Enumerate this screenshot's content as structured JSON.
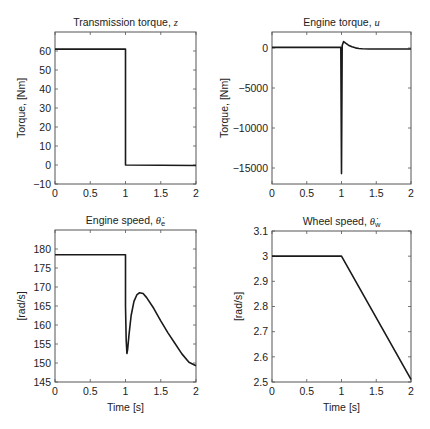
{
  "chart_data": [
    {
      "type": "line",
      "id": "transmission-torque",
      "title": "Transmission torque, ",
      "title_math": "z",
      "xlabel": "",
      "ylabel": "Torque, [Nm]",
      "xlim": [
        0,
        2
      ],
      "ylim": [
        -10,
        70
      ],
      "xticks": [
        0,
        0.5,
        1,
        1.5,
        2
      ],
      "xtick_labels": [
        "0",
        "0.5",
        "1",
        "1.5",
        "2"
      ],
      "yticks": [
        -10,
        0,
        10,
        20,
        30,
        40,
        50,
        60
      ],
      "ytick_labels": [
        "−10",
        "0",
        "10",
        "20",
        "30",
        "40",
        "50",
        "60"
      ],
      "box": [
        55,
        32,
        196,
        184
      ],
      "series": [
        {
          "name": "z",
          "x": [
            0,
            1,
            1,
            2
          ],
          "y": [
            61,
            61,
            0,
            -0.3
          ]
        }
      ]
    },
    {
      "type": "line",
      "id": "engine-torque",
      "title": "Engine torque, ",
      "title_math": "u",
      "xlabel": "",
      "ylabel": "Torque, [Nm]",
      "xlim": [
        0,
        2
      ],
      "ylim": [
        -17000,
        2000
      ],
      "xticks": [
        0,
        0.5,
        1,
        1.5,
        2
      ],
      "xtick_labels": [
        "0",
        "0.5",
        "1",
        "1.5",
        "2"
      ],
      "yticks": [
        -15000,
        -10000,
        -5000,
        0
      ],
      "ytick_labels": [
        "−15000",
        "−10000",
        "−5000",
        "0"
      ],
      "box": [
        272,
        32,
        411,
        184
      ],
      "series": [
        {
          "name": "u",
          "x": [
            0,
            0.99,
            1.0,
            1.01,
            1.03,
            1.06,
            1.1,
            1.15,
            1.2,
            1.25,
            1.3,
            1.4,
            1.5,
            1.7,
            2.0
          ],
          "y": [
            80,
            80,
            -15700,
            300,
            800,
            600,
            350,
            150,
            20,
            -60,
            -100,
            -120,
            -120,
            -120,
            -120
          ]
        }
      ]
    },
    {
      "type": "line",
      "id": "engine-speed",
      "title": "Engine speed, ",
      "title_math": "θ̇",
      "title_sub": "e",
      "xlabel": "Time [s]",
      "ylabel": "[rad/s]",
      "xlim": [
        0,
        2
      ],
      "ylim": [
        145,
        185
      ],
      "xticks": [
        0,
        0.5,
        1,
        1.5,
        2
      ],
      "xtick_labels": [
        "0",
        "0.5",
        "1",
        "1.5",
        "2"
      ],
      "yticks": [
        145,
        150,
        155,
        160,
        165,
        170,
        175,
        180
      ],
      "ytick_labels": [
        "145",
        "150",
        "155",
        "160",
        "165",
        "170",
        "175",
        "180"
      ],
      "box": [
        55,
        230,
        196,
        382
      ],
      "series": [
        {
          "name": "theta_e_dot",
          "x": [
            0,
            1.0,
            1.0,
            1.01,
            1.02,
            1.03,
            1.05,
            1.08,
            1.12,
            1.16,
            1.2,
            1.25,
            1.3,
            1.4,
            1.5,
            1.6,
            1.7,
            1.8,
            1.9,
            2.0
          ],
          "y": [
            178.5,
            178.5,
            165,
            156,
            152.5,
            153.5,
            157.5,
            162.5,
            166.2,
            167.9,
            168.5,
            168.3,
            167.2,
            164.4,
            161.1,
            158.0,
            155.2,
            152.4,
            150.2,
            149.3
          ]
        }
      ]
    },
    {
      "type": "line",
      "id": "wheel-speed",
      "title": "Wheel speed, ",
      "title_math": "θ̇",
      "title_sub": "w",
      "xlabel": "Time [s]",
      "ylabel": "[rad/s]",
      "xlim": [
        0,
        2
      ],
      "ylim": [
        2.5,
        3.1
      ],
      "xticks": [
        0,
        0.5,
        1,
        1.5,
        2
      ],
      "xtick_labels": [
        "0",
        "0.5",
        "1",
        "1.5",
        "2"
      ],
      "yticks": [
        2.5,
        2.6,
        2.7,
        2.8,
        2.9,
        3.0,
        3.1
      ],
      "ytick_labels": [
        "2.5",
        "2.6",
        "2.7",
        "2.8",
        "2.9",
        "3",
        "3.1"
      ],
      "box": [
        272,
        231,
        411,
        382
      ],
      "series": [
        {
          "name": "theta_w_dot",
          "x": [
            0,
            1,
            2
          ],
          "y": [
            3.0,
            3.0,
            2.51
          ]
        }
      ]
    }
  ],
  "colors": {
    "line": "#1a1a1a",
    "axis": "#555555",
    "background": "#ffffff"
  }
}
